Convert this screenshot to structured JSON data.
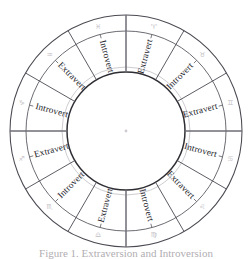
{
  "figure": {
    "center": {
      "x": 126,
      "y": 131
    },
    "radii": {
      "outer": 116,
      "band_inner": 100,
      "label_outer": 99,
      "inner": 59,
      "faint": 64
    },
    "colors": {
      "stroke_outer": "#4a4a52",
      "stroke_inner": "#2e2e34",
      "text": "#232329",
      "glyph": "#9a96a0",
      "background": "#ffffff"
    },
    "sector_count": 12,
    "sectors": [
      {
        "index": 0,
        "label": "Extravert",
        "angle_deg": 15,
        "glyph": "♈",
        "glyph_name": "aries-glyph"
      },
      {
        "index": 1,
        "label": "Introvert",
        "angle_deg": 45,
        "glyph": "♉",
        "glyph_name": "taurus-glyph"
      },
      {
        "index": 2,
        "label": "Extravert",
        "angle_deg": 75,
        "glyph": "♊",
        "glyph_name": "gemini-glyph"
      },
      {
        "index": 3,
        "label": "Introvert",
        "angle_deg": 105,
        "glyph": "♋",
        "glyph_name": "cancer-glyph"
      },
      {
        "index": 4,
        "label": "Extravert",
        "angle_deg": 135,
        "glyph": "♌",
        "glyph_name": "leo-glyph"
      },
      {
        "index": 5,
        "label": "Introvert",
        "angle_deg": 165,
        "glyph": "♍",
        "glyph_name": "virgo-glyph"
      },
      {
        "index": 6,
        "label": "Extravert",
        "angle_deg": 195,
        "glyph": "♎",
        "glyph_name": "libra-glyph"
      },
      {
        "index": 7,
        "label": "Introvert",
        "angle_deg": 225,
        "glyph": "♏",
        "glyph_name": "scorpio-glyph"
      },
      {
        "index": 8,
        "label": "Extravert",
        "angle_deg": 255,
        "glyph": "♐",
        "glyph_name": "sagittarius-glyph"
      },
      {
        "index": 9,
        "label": "Introvert",
        "angle_deg": 285,
        "glyph": "♑",
        "glyph_name": "capricorn-glyph"
      },
      {
        "index": 10,
        "label": "Extravert",
        "angle_deg": 315,
        "glyph": "♒",
        "glyph_name": "aquarius-glyph"
      },
      {
        "index": 11,
        "label": "Introvert",
        "angle_deg": 345,
        "glyph": "♓",
        "glyph_name": "pisces-glyph"
      }
    ],
    "caption": "Figure 1. Extraversion and Introversion"
  }
}
